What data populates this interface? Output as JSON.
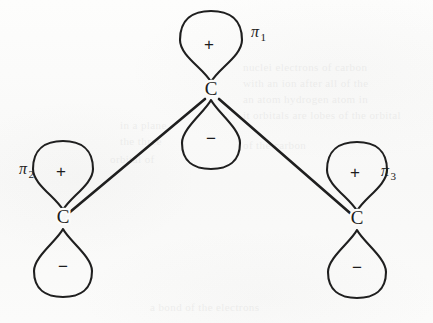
{
  "figure": {
    "kind": "chemical-orbital-diagram",
    "background_color": "#fbfbfa",
    "ink_color": "#1f1f1f"
  },
  "atoms": [
    {
      "id": "top",
      "label": "C",
      "x": 211,
      "y": 91
    },
    {
      "id": "left",
      "label": "C",
      "x": 63,
      "y": 219
    },
    {
      "id": "right",
      "label": "C",
      "x": 357,
      "y": 220
    }
  ],
  "bonds": [
    {
      "from": "top",
      "to": "left",
      "x1": 205,
      "y1": 99,
      "x2": 70,
      "y2": 212
    },
    {
      "from": "top",
      "to": "right",
      "x1": 219,
      "y1": 99,
      "x2": 350,
      "y2": 213
    }
  ],
  "orbitals": [
    {
      "id": "pi1",
      "name": "π",
      "subscript": "1",
      "atom": "top",
      "label_x": 251,
      "label_y": 33,
      "lobes": [
        {
          "sign": "+",
          "direction": "up",
          "sign_x": 209,
          "sign_y": 46,
          "tip_x": 211,
          "tip_y": 82,
          "bulb_cy": 40,
          "bulb_rx": 31,
          "bulb_ry": 29,
          "waist": 12
        },
        {
          "sign": "−",
          "direction": "down",
          "sign_x": 211,
          "sign_y": 140,
          "tip_x": 211,
          "tip_y": 100,
          "bulb_cy": 143,
          "bulb_rx": 29,
          "bulb_ry": 26,
          "waist": 11
        }
      ]
    },
    {
      "id": "pi2",
      "name": "π",
      "subscript": "2",
      "atom": "left",
      "label_x": 19,
      "label_y": 170,
      "lobes": [
        {
          "sign": "+",
          "direction": "up",
          "sign_x": 61,
          "sign_y": 173,
          "tip_x": 63,
          "tip_y": 210,
          "bulb_cy": 169,
          "bulb_rx": 30,
          "bulb_ry": 28,
          "waist": 12
        },
        {
          "sign": "−",
          "direction": "down",
          "sign_x": 63,
          "sign_y": 268,
          "tip_x": 63,
          "tip_y": 229,
          "bulb_cy": 271,
          "bulb_rx": 29,
          "bulb_ry": 26,
          "waist": 11
        }
      ]
    },
    {
      "id": "pi3",
      "name": "π",
      "subscript": "3",
      "atom": "right",
      "label_x": 381,
      "label_y": 172,
      "lobes": [
        {
          "sign": "+",
          "direction": "up",
          "sign_x": 355,
          "sign_y": 174,
          "tip_x": 357,
          "tip_y": 211,
          "bulb_cy": 170,
          "bulb_rx": 30,
          "bulb_ry": 28,
          "waist": 12
        },
        {
          "sign": "−",
          "direction": "down",
          "sign_x": 357,
          "sign_y": 269,
          "tip_x": 357,
          "tip_y": 230,
          "bulb_cy": 272,
          "bulb_rx": 29,
          "bulb_ry": 26,
          "waist": 11
        }
      ]
    }
  ],
  "ghost_text": {
    "note": "faint illegible bleed-through from the reverse side of the page",
    "lines": [
      {
        "text": "nuclei electrons of carbon",
        "x": 243,
        "y": 60
      },
      {
        "text": "with an  ion   after all  of the",
        "x": 243,
        "y": 76
      },
      {
        "text": "an atom  hydrogen atom in",
        "x": 243,
        "y": 92
      },
      {
        "text": "it  orbitals  are  lobes of  the  orbital",
        "x": 243,
        "y": 108
      },
      {
        "text": "of the  carbon",
        "x": 243,
        "y": 138
      },
      {
        "text": "in a plane",
        "x": 120,
        "y": 118
      },
      {
        "text": "the three",
        "x": 120,
        "y": 134
      },
      {
        "text": "orbital of",
        "x": 110,
        "y": 152
      },
      {
        "text": "a  bond  of the  electrons",
        "x": 150,
        "y": 300
      }
    ]
  }
}
